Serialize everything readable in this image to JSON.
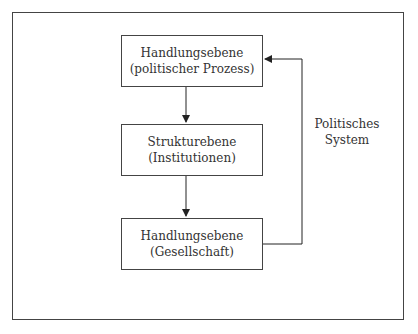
{
  "diagram": {
    "boxes": [
      {
        "line1": "Handlungsebene",
        "line2": "(politischer Prozess)"
      },
      {
        "line1": "Strukturebene",
        "line2": "(Institutionen)"
      },
      {
        "line1": "Handlungsebene",
        "line2": "(Gesellschaft)"
      }
    ],
    "feedback_label": {
      "line1": "Politisches",
      "line2": "System"
    },
    "colors": {
      "line": "#444444",
      "text": "#333333",
      "background": "#ffffff"
    }
  }
}
